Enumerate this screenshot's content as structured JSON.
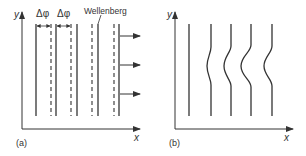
{
  "panel_a": {
    "label": "(a)",
    "axis_x": "x",
    "axis_y": "y",
    "delta_label_1": "Δφ",
    "delta_label_2": "Δφ",
    "crest_label": "Wellenberg"
  },
  "panel_b": {
    "label": "(b)",
    "axis_x": "x",
    "axis_y": "y"
  },
  "colors": {
    "line": "#333333",
    "background": "#ffffff"
  }
}
